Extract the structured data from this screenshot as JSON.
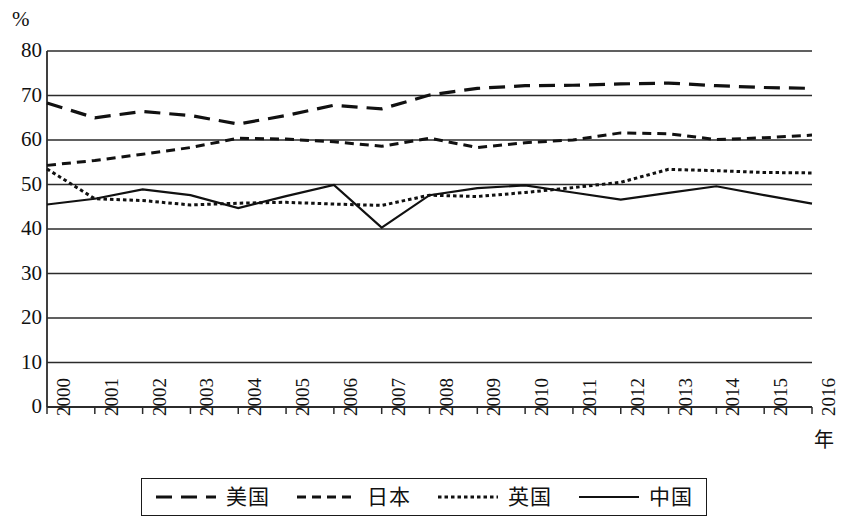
{
  "chart_data": {
    "type": "line",
    "title": "",
    "xlabel": "年",
    "ylabel": "%",
    "x": [
      "2000",
      "2001",
      "2002",
      "2003",
      "2004",
      "2005",
      "2006",
      "2007",
      "2008",
      "2009",
      "2010",
      "2011",
      "2012",
      "2013",
      "2014",
      "2015",
      "2016"
    ],
    "categories": [
      "2000",
      "2001",
      "2002",
      "2003",
      "2004",
      "2005",
      "2006",
      "2007",
      "2008",
      "2009",
      "2010",
      "2011",
      "2012",
      "2013",
      "2014",
      "2015",
      "2016"
    ],
    "ylim": [
      0,
      80
    ],
    "yticks": [
      0,
      10,
      20,
      30,
      40,
      50,
      60,
      70,
      80
    ],
    "grid": true,
    "legend_position": "bottom",
    "series": [
      {
        "name": "美国",
        "style": "long-dash",
        "color": "#111111",
        "values": [
          68.3,
          65.0,
          66.4,
          65.5,
          63.6,
          65.5,
          67.8,
          67.0,
          70.1,
          71.6,
          72.2,
          72.3,
          72.6,
          72.8,
          72.2,
          71.8,
          71.6
        ]
      },
      {
        "name": "日本",
        "style": "medium-dash",
        "color": "#111111",
        "values": [
          54.3,
          55.4,
          56.8,
          58.3,
          60.4,
          60.2,
          59.6,
          58.6,
          60.4,
          58.3,
          59.4,
          60.0,
          61.6,
          61.4,
          60.1,
          60.5,
          61.1
        ]
      },
      {
        "name": "英国",
        "style": "dotted",
        "color": "#111111",
        "values": [
          53.5,
          46.8,
          46.4,
          45.4,
          45.8,
          46.0,
          45.6,
          45.3,
          47.6,
          47.3,
          48.2,
          49.3,
          50.5,
          53.4,
          53.1,
          52.7,
          52.6
        ]
      },
      {
        "name": "中国",
        "style": "solid",
        "color": "#111111",
        "values": [
          45.5,
          46.8,
          48.9,
          47.6,
          44.7,
          47.4,
          49.9,
          40.3,
          47.6,
          49.2,
          49.8,
          48.2,
          46.6,
          48.1,
          49.6,
          47.6,
          45.7
        ]
      }
    ]
  },
  "legend": {
    "entries": [
      {
        "label": "美国",
        "style": "long-dash"
      },
      {
        "label": "日本",
        "style": "medium-dash"
      },
      {
        "label": "英国",
        "style": "dotted"
      },
      {
        "label": "中国",
        "style": "solid"
      }
    ]
  }
}
